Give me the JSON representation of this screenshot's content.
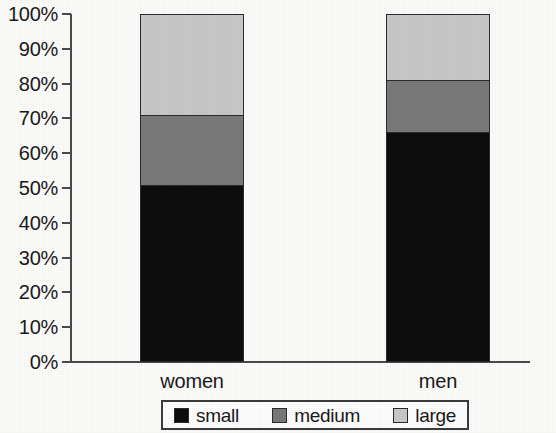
{
  "chart_data": {
    "type": "bar",
    "subtype": "stacked-bar-100",
    "title": "",
    "subtitle": "",
    "xlabel": "",
    "ylabel": "",
    "categories": [
      "women",
      "men"
    ],
    "series": [
      {
        "name": "small",
        "color": "#0d0d0d",
        "values": [
          51,
          66
        ]
      },
      {
        "name": "medium",
        "color": "#7a7a7a",
        "values": [
          20,
          15
        ]
      },
      {
        "name": "large",
        "color": "#c9c9c9",
        "values": [
          29,
          19
        ]
      }
    ],
    "cumulative_tops": {
      "women": {
        "small": 51,
        "medium": 71,
        "large": 100
      },
      "men": {
        "small": 66,
        "medium": 81,
        "large": 100
      }
    },
    "ylim": [
      0,
      100
    ],
    "y_tick_values": [
      0,
      10,
      20,
      30,
      40,
      50,
      60,
      70,
      80,
      90,
      100
    ],
    "y_tick_labels": [
      "0%",
      "10%",
      "20%",
      "30%",
      "40%",
      "50%",
      "60%",
      "70%",
      "80%",
      "90%",
      "100%"
    ],
    "grid": false,
    "legend_position": "bottom",
    "legend_entries": [
      "small",
      "medium",
      "large"
    ]
  },
  "axis": {
    "y_ticks": [
      {
        "label": "100%",
        "value": 100
      },
      {
        "label": "90%",
        "value": 90
      },
      {
        "label": "80%",
        "value": 80
      },
      {
        "label": "70%",
        "value": 70
      },
      {
        "label": "60%",
        "value": 60
      },
      {
        "label": "50%",
        "value": 50
      },
      {
        "label": "40%",
        "value": 40
      },
      {
        "label": "30%",
        "value": 30
      },
      {
        "label": "20%",
        "value": 20
      },
      {
        "label": "10%",
        "value": 10
      },
      {
        "label": "0%",
        "value": 0
      }
    ],
    "x_categories": [
      {
        "label": "women"
      },
      {
        "label": "men"
      }
    ]
  },
  "legend": {
    "items": [
      {
        "label": "small",
        "color": "#0d0d0d"
      },
      {
        "label": "medium",
        "color": "#7a7a7a"
      },
      {
        "label": "large",
        "color": "#c9c9c9"
      }
    ]
  },
  "colors": {
    "small": "#0d0d0d",
    "medium": "#7a7a7a",
    "large": "#c9c9c9",
    "axis": "#4a4a4a",
    "outline": "#2b2b2b",
    "background": "#fdfdfc"
  }
}
